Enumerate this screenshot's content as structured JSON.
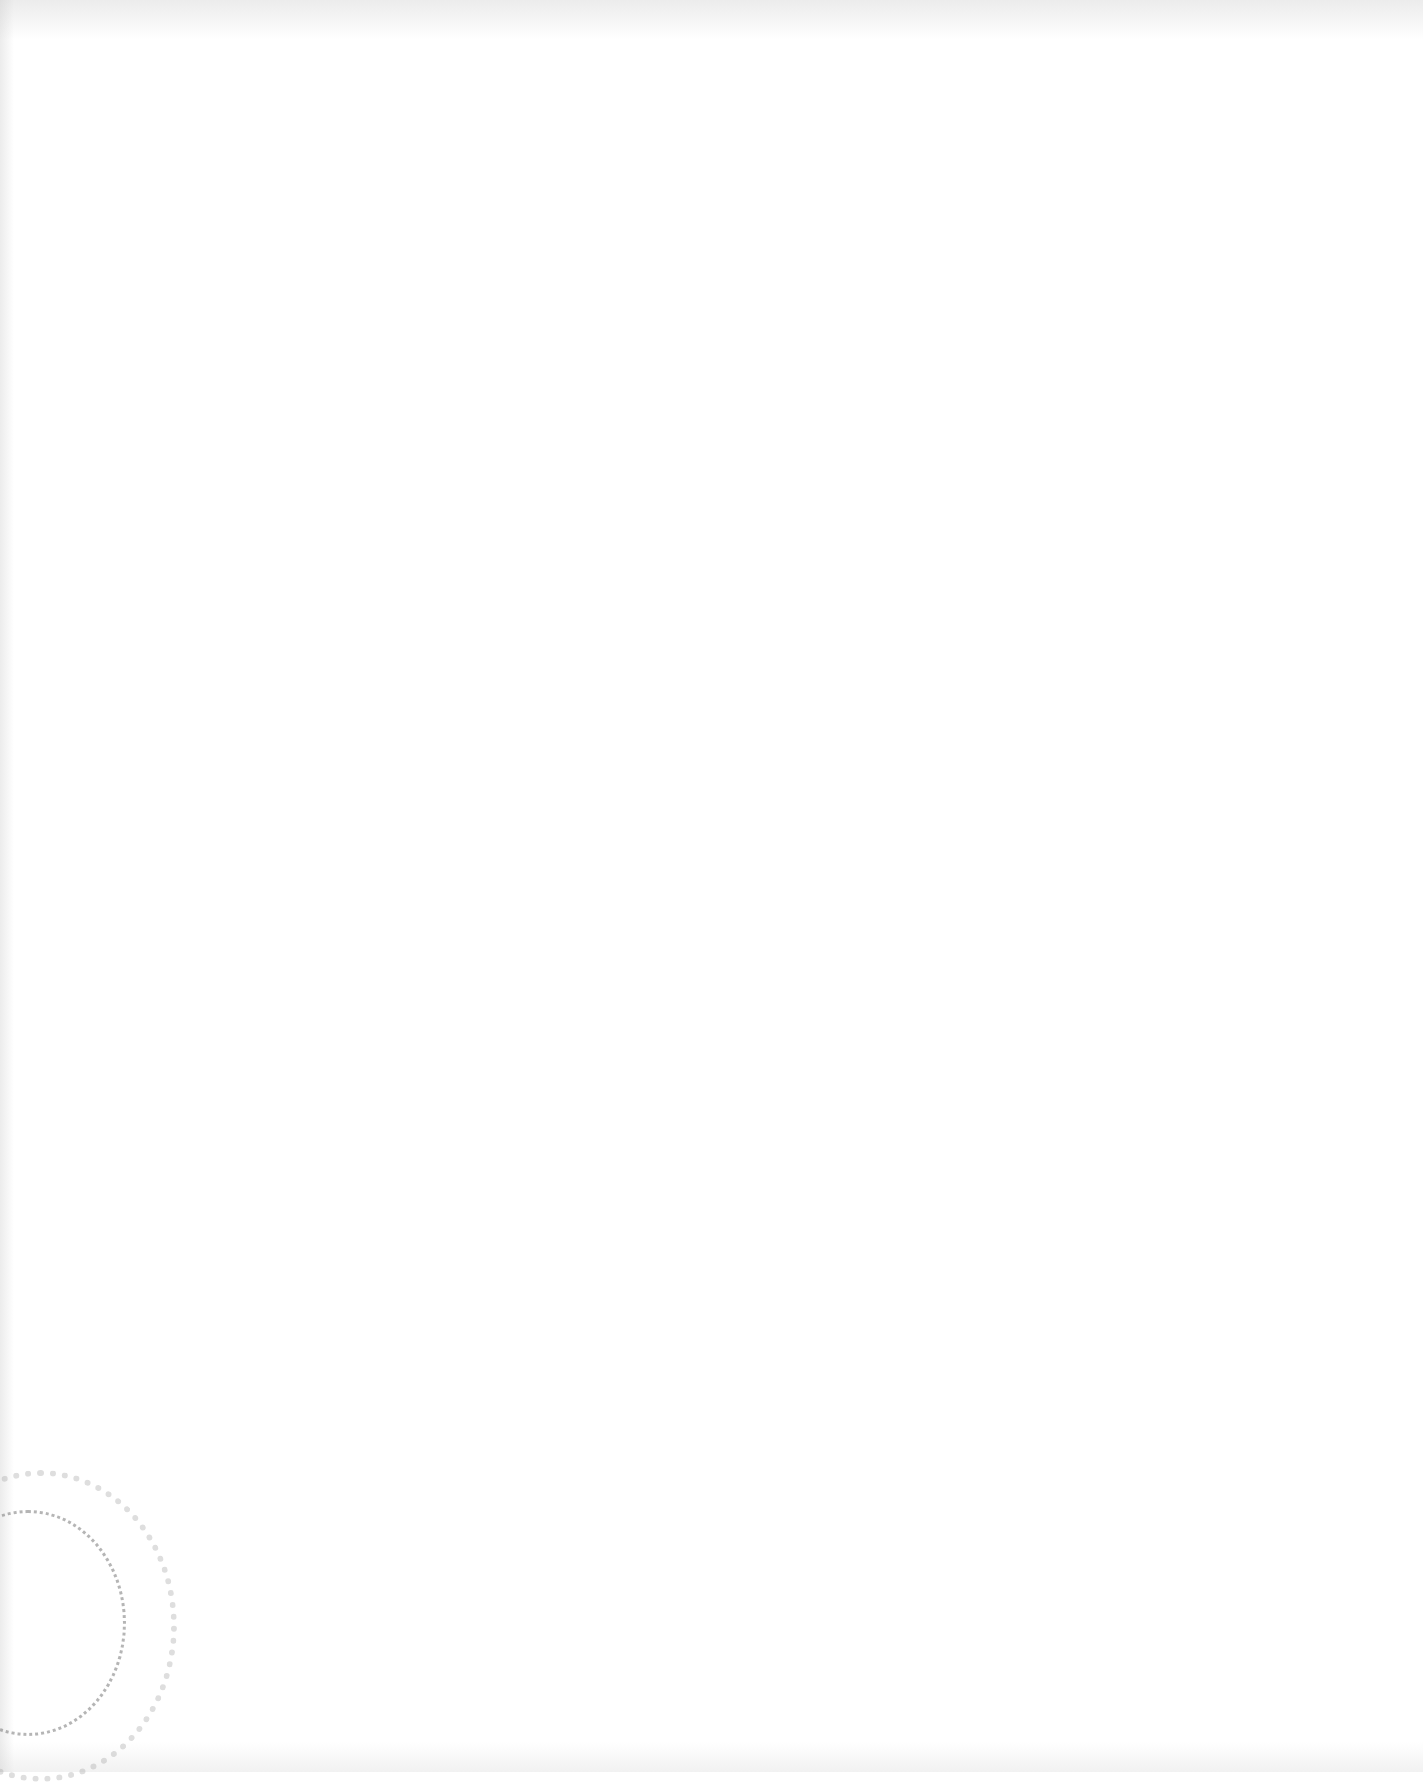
{
  "document": {
    "type": "blank scanned page",
    "text": ""
  },
  "marks": {
    "stamp": "faint circular seal impression (bleed-through), lower-left corner"
  }
}
